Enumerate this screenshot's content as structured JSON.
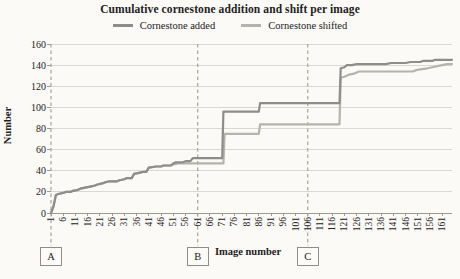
{
  "title": "Cumulative cornestone addition and shift per image",
  "axes": {
    "x_label": "Image number",
    "y_label": "Number"
  },
  "chart_data": {
    "type": "line",
    "title": "Cumulative cornestone addition and shift per image",
    "xlabel": "Image number",
    "ylabel": "Number",
    "xlim": [
      1,
      165
    ],
    "ylim": [
      0,
      160
    ],
    "grid": "horizontal-only",
    "legend_position": "top",
    "yticks": [
      0,
      20,
      40,
      60,
      80,
      100,
      120,
      140,
      160
    ],
    "xticks": [
      1,
      6,
      11,
      16,
      21,
      26,
      31,
      36,
      41,
      46,
      51,
      56,
      61,
      66,
      71,
      76,
      81,
      86,
      91,
      96,
      101,
      106,
      111,
      116,
      121,
      126,
      131,
      136,
      141,
      146,
      151,
      156,
      161
    ],
    "vlines": [
      {
        "label": "A",
        "x": 1
      },
      {
        "label": "B",
        "x": 61
      },
      {
        "label": "C",
        "x": 106
      }
    ],
    "series": [
      {
        "name": "Cornestone added",
        "color": "#8e8d8a",
        "points": [
          [
            1,
            0
          ],
          [
            2,
            6
          ],
          [
            3,
            17
          ],
          [
            4,
            18
          ],
          [
            6,
            19
          ],
          [
            7,
            20
          ],
          [
            9,
            20
          ],
          [
            10,
            21
          ],
          [
            12,
            22
          ],
          [
            13,
            23
          ],
          [
            15,
            24
          ],
          [
            17,
            25
          ],
          [
            19,
            26
          ],
          [
            20,
            27
          ],
          [
            22,
            28
          ],
          [
            23,
            29
          ],
          [
            25,
            30
          ],
          [
            28,
            30
          ],
          [
            29,
            31
          ],
          [
            31,
            32
          ],
          [
            32,
            33
          ],
          [
            34,
            33
          ],
          [
            35,
            37
          ],
          [
            37,
            38
          ],
          [
            39,
            39
          ],
          [
            40,
            39
          ],
          [
            41,
            43
          ],
          [
            44,
            44
          ],
          [
            46,
            44
          ],
          [
            47,
            45
          ],
          [
            50,
            45
          ],
          [
            51,
            47
          ],
          [
            52,
            48
          ],
          [
            55,
            48
          ],
          [
            56,
            49
          ],
          [
            58,
            49
          ],
          [
            59,
            52
          ],
          [
            71,
            52
          ],
          [
            71.5,
            96
          ],
          [
            86,
            96
          ],
          [
            86.5,
            104
          ],
          [
            119,
            104
          ],
          [
            119.5,
            137
          ],
          [
            121,
            138
          ],
          [
            122,
            140
          ],
          [
            124,
            140
          ],
          [
            126,
            141
          ],
          [
            138,
            141
          ],
          [
            140,
            142
          ],
          [
            146,
            142
          ],
          [
            148,
            143
          ],
          [
            152,
            143
          ],
          [
            153,
            144
          ],
          [
            157,
            144
          ],
          [
            158,
            145
          ],
          [
            165,
            145
          ]
        ]
      },
      {
        "name": "Cornestone shifted",
        "color": "#b4b3ae",
        "points": [
          [
            1,
            0
          ],
          [
            2,
            6
          ],
          [
            3,
            17
          ],
          [
            4,
            18
          ],
          [
            6,
            19
          ],
          [
            7,
            20
          ],
          [
            9,
            20
          ],
          [
            10,
            21
          ],
          [
            12,
            22
          ],
          [
            13,
            23
          ],
          [
            15,
            24
          ],
          [
            17,
            25
          ],
          [
            19,
            26
          ],
          [
            20,
            27
          ],
          [
            22,
            28
          ],
          [
            23,
            29
          ],
          [
            25,
            30
          ],
          [
            28,
            30
          ],
          [
            29,
            31
          ],
          [
            31,
            32
          ],
          [
            32,
            33
          ],
          [
            34,
            33
          ],
          [
            35,
            37
          ],
          [
            37,
            38
          ],
          [
            39,
            39
          ],
          [
            40,
            39
          ],
          [
            41,
            43
          ],
          [
            44,
            44
          ],
          [
            46,
            44
          ],
          [
            47,
            45
          ],
          [
            50,
            45
          ],
          [
            51,
            46
          ],
          [
            53,
            47
          ],
          [
            71.5,
            47
          ],
          [
            72,
            75
          ],
          [
            86,
            75
          ],
          [
            86.5,
            84
          ],
          [
            119,
            84
          ],
          [
            119.5,
            128
          ],
          [
            121,
            129
          ],
          [
            123,
            131
          ],
          [
            125,
            132
          ],
          [
            127,
            134
          ],
          [
            149,
            134
          ],
          [
            150,
            135
          ],
          [
            152,
            136
          ],
          [
            155,
            137
          ],
          [
            157,
            138
          ],
          [
            159,
            139
          ],
          [
            161,
            140
          ],
          [
            163,
            141
          ],
          [
            165,
            141
          ]
        ]
      }
    ]
  },
  "style": {
    "gridline_color": "#d9d8d2",
    "axis_color": "#9b9992",
    "dashed_line_color": "#a5a39c"
  }
}
